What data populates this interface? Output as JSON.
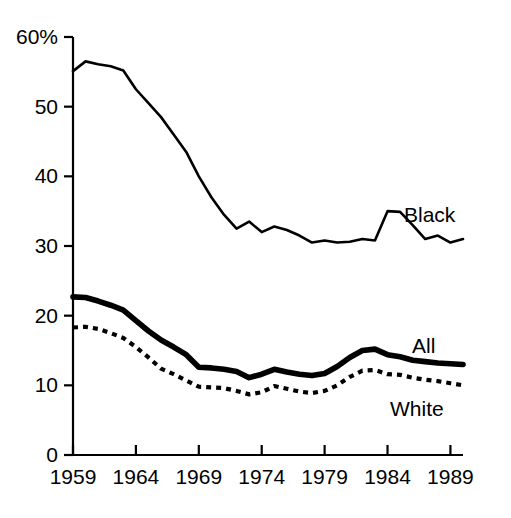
{
  "chart_data": {
    "type": "line",
    "title": "",
    "subtitle": "",
    "xlabel": "",
    "ylabel": "",
    "xlim": [
      1959,
      1990
    ],
    "ylim": [
      0,
      60
    ],
    "yticks": [
      0,
      10,
      20,
      30,
      40,
      50,
      60
    ],
    "ytick_labels": [
      "0",
      "10",
      "20",
      "30",
      "40",
      "50",
      "60%"
    ],
    "xticks": [
      1959,
      1964,
      1969,
      1974,
      1979,
      1984,
      1989
    ],
    "xtick_labels": [
      "1959",
      "1964",
      "1969",
      "1974",
      "1979",
      "1984",
      "1989"
    ],
    "grid": false,
    "legend_position": "inline-right",
    "x": [
      1959,
      1960,
      1961,
      1962,
      1963,
      1964,
      1965,
      1966,
      1967,
      1968,
      1969,
      1970,
      1971,
      1972,
      1973,
      1974,
      1975,
      1976,
      1977,
      1978,
      1979,
      1980,
      1981,
      1982,
      1983,
      1984,
      1985,
      1986,
      1987,
      1988,
      1989,
      1990
    ],
    "series": [
      {
        "name": "Black",
        "style": "thin-solid",
        "label": "Black",
        "values": [
          55.1,
          56.5,
          56.1,
          55.8,
          55.2,
          52.5,
          50.5,
          48.5,
          46.0,
          43.5,
          40.0,
          37.0,
          34.5,
          32.5,
          33.5,
          32.0,
          32.8,
          32.3,
          31.5,
          30.5,
          30.8,
          30.5,
          30.6,
          31.0,
          30.8,
          35.0,
          34.9,
          33.0,
          31.0,
          31.5,
          30.5,
          31.0
        ]
      },
      {
        "name": "All",
        "style": "thick-solid",
        "label": "All",
        "values": [
          22.7,
          22.6,
          22.1,
          21.5,
          20.8,
          19.3,
          17.8,
          16.5,
          15.5,
          14.4,
          12.6,
          12.5,
          12.3,
          12.0,
          11.1,
          11.6,
          12.3,
          11.9,
          11.6,
          11.4,
          11.7,
          12.7,
          14.0,
          15.0,
          15.2,
          14.4,
          14.1,
          13.6,
          13.4,
          13.2,
          13.1,
          13.0
        ]
      },
      {
        "name": "White",
        "style": "dotted",
        "label": "White",
        "values": [
          18.3,
          18.4,
          18.1,
          17.5,
          16.8,
          15.5,
          14.0,
          12.4,
          11.6,
          10.7,
          9.8,
          9.7,
          9.6,
          9.2,
          8.7,
          9.0,
          9.9,
          9.5,
          9.1,
          8.9,
          9.2,
          10.0,
          11.2,
          12.1,
          12.2,
          11.6,
          11.5,
          11.1,
          10.8,
          10.6,
          10.3,
          10.0
        ]
      }
    ]
  },
  "labels": {
    "black": "Black",
    "all": "All",
    "white": "White"
  },
  "colors": {
    "ink": "#000000",
    "background": "#ffffff"
  }
}
